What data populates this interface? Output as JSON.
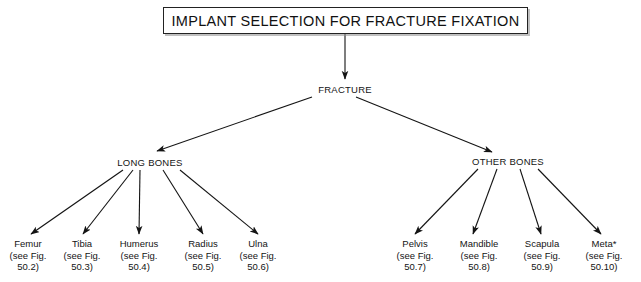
{
  "title": {
    "text": "IMPLANT SELECTION FOR FRACTURE FIXATION"
  },
  "nodes": {
    "root": "FRACTURE",
    "long_bones": "LONG BONES",
    "other_bones": "OTHER BONES"
  },
  "long_bone_leaves": [
    {
      "name": "Femur",
      "ref_line1": "(see Fig.",
      "ref_line2": "50.2)"
    },
    {
      "name": "Tibia",
      "ref_line1": "(see Fig.",
      "ref_line2": "50.3)"
    },
    {
      "name": "Humerus",
      "ref_line1": "(see Fig.",
      "ref_line2": "50.4)"
    },
    {
      "name": "Radius",
      "ref_line1": "(see Fig.",
      "ref_line2": "50.5)"
    },
    {
      "name": "Ulna",
      "ref_line1": "(see Fig.",
      "ref_line2": "50.6)"
    }
  ],
  "other_bone_leaves": [
    {
      "name": "Pelvis",
      "ref_line1": "(see Fig.",
      "ref_line2": "50.7)"
    },
    {
      "name": "Mandible",
      "ref_line1": "(see Fig.",
      "ref_line2": "50.8)"
    },
    {
      "name": "Scapula",
      "ref_line1": "(see Fig.",
      "ref_line2": "50.9)"
    },
    {
      "name": "Meta*",
      "ref_line1": "(see Fig.",
      "ref_line2": "50.10)"
    }
  ],
  "colors": {
    "background": "#ffffff",
    "ink": "#141414",
    "box_border": "#222222"
  }
}
